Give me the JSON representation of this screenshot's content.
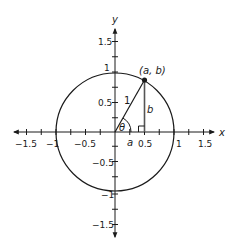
{
  "diagram": {
    "axes": {
      "x_label": "x",
      "y_label": "y",
      "x_ticks": [
        {
          "value": -1.5,
          "label": "−1.5"
        },
        {
          "value": -1,
          "label": "−1"
        },
        {
          "value": -0.5,
          "label": "−0.5"
        },
        {
          "value": 0.5,
          "label": "0.5"
        },
        {
          "value": 1,
          "label": "1"
        },
        {
          "value": 1.5,
          "label": "1.5"
        }
      ],
      "y_ticks": [
        {
          "value": 1.5,
          "label": "1.5"
        },
        {
          "value": 1,
          "label": "1"
        },
        {
          "value": 0.5,
          "label": "0.5"
        },
        {
          "value": -0.5,
          "label": "−0.5"
        },
        {
          "value": -1,
          "label": "−1"
        },
        {
          "value": -1.5,
          "label": "−1.5"
        }
      ],
      "minor_tick_step": 0.25,
      "range": [
        -1.75,
        1.75
      ]
    },
    "circle": {
      "center": [
        0,
        0
      ],
      "radius": 1
    },
    "point": {
      "label": "(a, b)",
      "x": 0.5,
      "y": 0.866
    },
    "labels": {
      "hypotenuse": "1",
      "vertical_leg": "b",
      "horizontal_leg": "a",
      "angle": "θ"
    },
    "colors": {
      "stroke": "#1a1a1a",
      "leg_stroke": "#555555",
      "background": "#ffffff"
    }
  }
}
